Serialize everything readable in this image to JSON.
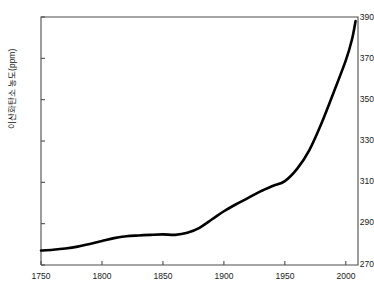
{
  "figure": {
    "title_cropped": "",
    "background_color": "#ffffff",
    "line_color": "#000000",
    "axis_color": "#4d4d4d"
  },
  "axes": {
    "y_axis_label": "이산화탄소 농도(ppm)",
    "y_ticks": [
      270,
      290,
      310,
      330,
      350,
      370,
      390
    ],
    "x_ticks": [
      1750,
      1800,
      1850,
      1900,
      1950,
      2000
    ],
    "y_tick_labels": [
      "270",
      "290",
      "310",
      "330",
      "350",
      "370",
      "390"
    ],
    "x_tick_labels": [
      "1750",
      "1800",
      "1850",
      "1900",
      "1950",
      "2000"
    ],
    "x_label": ""
  },
  "chart_data": {
    "type": "line",
    "title": "",
    "xlabel": "",
    "ylabel": "이산화탄소 농도(ppm)",
    "xlim": [
      1750,
      2010
    ],
    "ylim": [
      270,
      390
    ],
    "grid": false,
    "legend": null,
    "series": [
      {
        "name": "이산화탄소 농도",
        "x": [
          1750,
          1760,
          1770,
          1780,
          1790,
          1800,
          1810,
          1820,
          1830,
          1840,
          1850,
          1860,
          1870,
          1880,
          1890,
          1900,
          1910,
          1920,
          1930,
          1940,
          1950,
          1960,
          1970,
          1980,
          1990,
          2000,
          2005,
          2008
        ],
        "values": [
          277.0,
          277.4,
          278.0,
          278.9,
          280.2,
          281.6,
          283.0,
          283.9,
          284.3,
          284.6,
          284.8,
          284.6,
          285.6,
          288.0,
          292.0,
          296.0,
          299.4,
          302.5,
          305.6,
          308.2,
          310.6,
          316.5,
          325.5,
          338.5,
          353.5,
          369.0,
          379.0,
          388.0
        ]
      }
    ]
  },
  "plot_geometry": {
    "left": 41,
    "right": 358,
    "top": 17,
    "bottom": 265
  }
}
